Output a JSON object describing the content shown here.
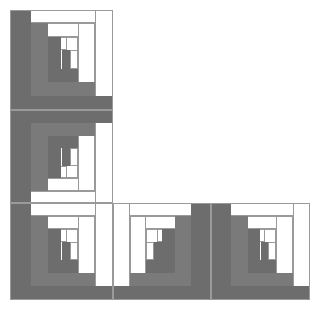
{
  "artwork": {
    "title": "Log Cabin Quilt Block Arrangement",
    "layout": "L-shape",
    "block_count": 5,
    "canvas": {
      "width": 319,
      "height": 312,
      "background": "#ffffff"
    },
    "colors": {
      "dark_gray": "#6d6d6d",
      "mid_gray": "#7a7a7a",
      "white": "#ffffff",
      "outline": "#9a9a9a"
    },
    "grid": {
      "columns_x": [
        10,
        113,
        211,
        310
      ],
      "rows_y": [
        10,
        110,
        203,
        300
      ]
    },
    "blocks": [
      {
        "name": "block-top-left",
        "row": 0,
        "col": 0,
        "x": 10,
        "y": 10,
        "w": 103,
        "h": 100,
        "orientation": "dark-left-bottom",
        "logs": [
          {
            "c": "white",
            "x": 0.0,
            "y": 0.0,
            "w": 1.0,
            "h": 0.13
          },
          {
            "c": "white",
            "x": 0.83,
            "y": 0.0,
            "w": 0.17,
            "h": 1.0
          },
          {
            "c": "dark",
            "x": 0.0,
            "y": 0.0,
            "w": 0.2,
            "h": 1.0
          },
          {
            "c": "dark",
            "x": 0.0,
            "y": 0.86,
            "w": 1.0,
            "h": 0.14
          },
          {
            "c": "white",
            "x": 0.2,
            "y": 0.13,
            "w": 0.63,
            "h": 0.14
          },
          {
            "c": "white",
            "x": 0.66,
            "y": 0.13,
            "w": 0.17,
            "h": 0.73
          },
          {
            "c": "mid",
            "x": 0.2,
            "y": 0.13,
            "w": 0.17,
            "h": 0.73
          },
          {
            "c": "mid",
            "x": 0.2,
            "y": 0.72,
            "w": 0.63,
            "h": 0.14
          },
          {
            "c": "white",
            "x": 0.37,
            "y": 0.27,
            "w": 0.29,
            "h": 0.13
          },
          {
            "c": "white",
            "x": 0.54,
            "y": 0.27,
            "w": 0.12,
            "h": 0.45
          },
          {
            "c": "dark",
            "x": 0.37,
            "y": 0.27,
            "w": 0.13,
            "h": 0.45
          },
          {
            "c": "dark",
            "x": 0.37,
            "y": 0.59,
            "w": 0.29,
            "h": 0.13
          },
          {
            "c": "white",
            "x": 0.5,
            "y": 0.4,
            "w": 0.16,
            "h": 0.12
          },
          {
            "c": "white",
            "x": 0.58,
            "y": 0.4,
            "w": 0.08,
            "h": 0.19
          },
          {
            "c": "dark",
            "x": 0.5,
            "y": 0.4,
            "w": 0.08,
            "h": 0.19
          }
        ]
      },
      {
        "name": "block-middle-left",
        "row": 1,
        "col": 0,
        "x": 10,
        "y": 110,
        "w": 103,
        "h": 93,
        "orientation": "dark-left-top",
        "logs": [
          {
            "c": "white",
            "x": 0.0,
            "y": 0.87,
            "w": 1.0,
            "h": 0.13
          },
          {
            "c": "white",
            "x": 0.83,
            "y": 0.0,
            "w": 0.17,
            "h": 1.0
          },
          {
            "c": "dark",
            "x": 0.0,
            "y": 0.0,
            "w": 0.2,
            "h": 1.0
          },
          {
            "c": "dark",
            "x": 0.0,
            "y": 0.0,
            "w": 1.0,
            "h": 0.14
          },
          {
            "c": "white",
            "x": 0.2,
            "y": 0.73,
            "w": 0.63,
            "h": 0.14
          },
          {
            "c": "white",
            "x": 0.66,
            "y": 0.14,
            "w": 0.17,
            "h": 0.73
          },
          {
            "c": "mid",
            "x": 0.2,
            "y": 0.14,
            "w": 0.17,
            "h": 0.73
          },
          {
            "c": "mid",
            "x": 0.2,
            "y": 0.14,
            "w": 0.63,
            "h": 0.14
          },
          {
            "c": "white",
            "x": 0.37,
            "y": 0.6,
            "w": 0.29,
            "h": 0.13
          },
          {
            "c": "white",
            "x": 0.54,
            "y": 0.28,
            "w": 0.12,
            "h": 0.45
          },
          {
            "c": "dark",
            "x": 0.37,
            "y": 0.28,
            "w": 0.13,
            "h": 0.45
          },
          {
            "c": "dark",
            "x": 0.37,
            "y": 0.28,
            "w": 0.29,
            "h": 0.13
          },
          {
            "c": "white",
            "x": 0.5,
            "y": 0.48,
            "w": 0.16,
            "h": 0.12
          },
          {
            "c": "white",
            "x": 0.58,
            "y": 0.41,
            "w": 0.08,
            "h": 0.19
          },
          {
            "c": "dark",
            "x": 0.5,
            "y": 0.41,
            "w": 0.08,
            "h": 0.19
          }
        ]
      },
      {
        "name": "block-bottom-left",
        "row": 2,
        "col": 0,
        "x": 10,
        "y": 203,
        "w": 103,
        "h": 97,
        "orientation": "dark-left-bottom",
        "logs": [
          {
            "c": "white",
            "x": 0.0,
            "y": 0.0,
            "w": 1.0,
            "h": 0.13
          },
          {
            "c": "white",
            "x": 0.83,
            "y": 0.0,
            "w": 0.17,
            "h": 1.0
          },
          {
            "c": "dark",
            "x": 0.0,
            "y": 0.0,
            "w": 0.2,
            "h": 1.0
          },
          {
            "c": "dark",
            "x": 0.0,
            "y": 0.86,
            "w": 1.0,
            "h": 0.14
          },
          {
            "c": "white",
            "x": 0.2,
            "y": 0.13,
            "w": 0.63,
            "h": 0.14
          },
          {
            "c": "white",
            "x": 0.66,
            "y": 0.13,
            "w": 0.17,
            "h": 0.73
          },
          {
            "c": "mid",
            "x": 0.2,
            "y": 0.13,
            "w": 0.17,
            "h": 0.73
          },
          {
            "c": "mid",
            "x": 0.2,
            "y": 0.72,
            "w": 0.63,
            "h": 0.14
          },
          {
            "c": "white",
            "x": 0.37,
            "y": 0.27,
            "w": 0.29,
            "h": 0.13
          },
          {
            "c": "white",
            "x": 0.54,
            "y": 0.27,
            "w": 0.12,
            "h": 0.45
          },
          {
            "c": "dark",
            "x": 0.37,
            "y": 0.27,
            "w": 0.13,
            "h": 0.45
          },
          {
            "c": "dark",
            "x": 0.37,
            "y": 0.59,
            "w": 0.29,
            "h": 0.13
          },
          {
            "c": "white",
            "x": 0.5,
            "y": 0.4,
            "w": 0.16,
            "h": 0.12
          },
          {
            "c": "white",
            "x": 0.58,
            "y": 0.4,
            "w": 0.08,
            "h": 0.19
          },
          {
            "c": "dark",
            "x": 0.5,
            "y": 0.4,
            "w": 0.08,
            "h": 0.19
          }
        ]
      },
      {
        "name": "block-bottom-middle",
        "row": 2,
        "col": 1,
        "x": 113,
        "y": 203,
        "w": 98,
        "h": 97,
        "orientation": "dark-right-bottom",
        "logs": [
          {
            "c": "white",
            "x": 0.0,
            "y": 0.0,
            "w": 1.0,
            "h": 0.13
          },
          {
            "c": "white",
            "x": 0.0,
            "y": 0.0,
            "w": 0.17,
            "h": 1.0
          },
          {
            "c": "dark",
            "x": 0.8,
            "y": 0.0,
            "w": 0.2,
            "h": 1.0
          },
          {
            "c": "dark",
            "x": 0.0,
            "y": 0.86,
            "w": 1.0,
            "h": 0.14
          },
          {
            "c": "white",
            "x": 0.17,
            "y": 0.13,
            "w": 0.63,
            "h": 0.14
          },
          {
            "c": "white",
            "x": 0.17,
            "y": 0.13,
            "w": 0.17,
            "h": 0.73
          },
          {
            "c": "mid",
            "x": 0.63,
            "y": 0.13,
            "w": 0.17,
            "h": 0.73
          },
          {
            "c": "mid",
            "x": 0.17,
            "y": 0.72,
            "w": 0.63,
            "h": 0.14
          },
          {
            "c": "white",
            "x": 0.34,
            "y": 0.27,
            "w": 0.29,
            "h": 0.13
          },
          {
            "c": "white",
            "x": 0.34,
            "y": 0.27,
            "w": 0.12,
            "h": 0.45
          },
          {
            "c": "dark",
            "x": 0.5,
            "y": 0.27,
            "w": 0.13,
            "h": 0.45
          },
          {
            "c": "dark",
            "x": 0.34,
            "y": 0.59,
            "w": 0.29,
            "h": 0.13
          },
          {
            "c": "white",
            "x": 0.34,
            "y": 0.4,
            "w": 0.16,
            "h": 0.12
          },
          {
            "c": "white",
            "x": 0.34,
            "y": 0.4,
            "w": 0.08,
            "h": 0.19
          },
          {
            "c": "dark",
            "x": 0.42,
            "y": 0.4,
            "w": 0.08,
            "h": 0.19
          }
        ]
      },
      {
        "name": "block-bottom-right",
        "row": 2,
        "col": 2,
        "x": 211,
        "y": 203,
        "w": 99,
        "h": 97,
        "orientation": "dark-left-bottom",
        "logs": [
          {
            "c": "white",
            "x": 0.0,
            "y": 0.0,
            "w": 1.0,
            "h": 0.13
          },
          {
            "c": "white",
            "x": 0.83,
            "y": 0.0,
            "w": 0.17,
            "h": 1.0
          },
          {
            "c": "dark",
            "x": 0.0,
            "y": 0.0,
            "w": 0.2,
            "h": 1.0
          },
          {
            "c": "dark",
            "x": 0.0,
            "y": 0.86,
            "w": 1.0,
            "h": 0.14
          },
          {
            "c": "white",
            "x": 0.2,
            "y": 0.13,
            "w": 0.63,
            "h": 0.14
          },
          {
            "c": "white",
            "x": 0.66,
            "y": 0.13,
            "w": 0.17,
            "h": 0.73
          },
          {
            "c": "mid",
            "x": 0.2,
            "y": 0.13,
            "w": 0.17,
            "h": 0.73
          },
          {
            "c": "mid",
            "x": 0.2,
            "y": 0.72,
            "w": 0.63,
            "h": 0.14
          },
          {
            "c": "white",
            "x": 0.37,
            "y": 0.27,
            "w": 0.29,
            "h": 0.13
          },
          {
            "c": "white",
            "x": 0.54,
            "y": 0.27,
            "w": 0.12,
            "h": 0.45
          },
          {
            "c": "dark",
            "x": 0.37,
            "y": 0.27,
            "w": 0.13,
            "h": 0.45
          },
          {
            "c": "dark",
            "x": 0.37,
            "y": 0.59,
            "w": 0.29,
            "h": 0.13
          },
          {
            "c": "white",
            "x": 0.5,
            "y": 0.4,
            "w": 0.16,
            "h": 0.12
          },
          {
            "c": "white",
            "x": 0.58,
            "y": 0.4,
            "w": 0.08,
            "h": 0.19
          },
          {
            "c": "dark",
            "x": 0.5,
            "y": 0.4,
            "w": 0.08,
            "h": 0.19
          }
        ]
      }
    ]
  }
}
